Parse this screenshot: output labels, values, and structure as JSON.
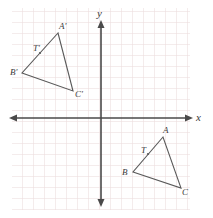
{
  "figure": {
    "title_visible": false,
    "width": 213,
    "height": 218,
    "background_color": "#ffffff"
  },
  "grid": {
    "visible": true,
    "cell_size": 11,
    "color": "#e9d9da",
    "left": 12,
    "top": 8,
    "right": 190,
    "bottom": 210
  },
  "axes": {
    "color": "#4a4a4a",
    "origin": {
      "x": 101,
      "y": 118
    },
    "x_axis": {
      "label": "x",
      "label_x": 196,
      "label_y": 112,
      "start_x": 10,
      "end_x": 193,
      "y": 118,
      "arrows": "both"
    },
    "y_axis": {
      "label": "y",
      "label_x": 97,
      "label_y": 8,
      "start_y": 22,
      "end_y": 206,
      "x": 101,
      "arrows": "both"
    }
  },
  "chart_data": {
    "type": "scatter",
    "title": "",
    "xlabel": "x",
    "ylabel": "y",
    "grid": true,
    "legend": "none",
    "shapes": [
      {
        "name": "triangle-a-prime-b-prime-c-prime",
        "quadrant": "II",
        "stroke": "#5a5a5a",
        "points": [
          {
            "label": "A'",
            "px": 58,
            "py": 33,
            "label_px": 59,
            "label_py": 22
          },
          {
            "label": "B'",
            "px": 22,
            "py": 73,
            "label_px": 10,
            "label_py": 68
          },
          {
            "label": "C'",
            "px": 73,
            "py": 91,
            "label_px": 75,
            "label_py": 90
          }
        ],
        "side_marker": {
          "label": "T'",
          "px": 40,
          "py": 53,
          "label_px": 33,
          "label_py": 44
        }
      },
      {
        "name": "triangle-a-b-c",
        "quadrant": "IV",
        "stroke": "#5a5a5a",
        "points": [
          {
            "label": "A",
            "px": 163,
            "py": 137,
            "label_px": 163,
            "label_py": 126
          },
          {
            "label": "B",
            "px": 133,
            "py": 172,
            "label_px": 122,
            "label_py": 168
          },
          {
            "label": "C",
            "px": 181,
            "py": 188,
            "label_px": 182,
            "label_py": 188
          }
        ],
        "side_marker": {
          "label": "T",
          "px": 148,
          "py": 154,
          "label_px": 141,
          "label_py": 146
        }
      }
    ]
  }
}
